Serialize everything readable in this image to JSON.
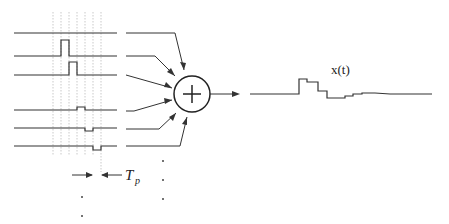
{
  "diagram": {
    "period_label": "T",
    "period_subscript": "p",
    "output_label": "x(t)",
    "summer_symbol": "+",
    "channels": [
      {
        "id": 0,
        "pulse": null
      },
      {
        "id": 1,
        "pulse": {
          "slot": 1,
          "amplitude": 1.0
        }
      },
      {
        "id": 2,
        "pulse": {
          "slot": 2,
          "amplitude": 1.0
        }
      },
      {
        "id": 3,
        "pulse": {
          "slot": 3,
          "amplitude": 0.3
        }
      },
      {
        "id": 4,
        "pulse": {
          "slot": 4,
          "amplitude": -0.6
        }
      },
      {
        "id": 5,
        "pulse": {
          "slot": 5,
          "amplitude": -0.6
        }
      }
    ],
    "ellipsis": "vertical dots indicating more channels"
  }
}
